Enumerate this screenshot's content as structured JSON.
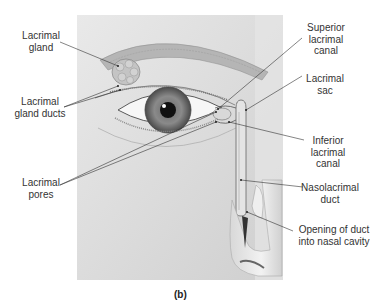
{
  "figure": {
    "caption": "(b)"
  },
  "labels": {
    "lacrimal_gland": "Lacrimal\ngland",
    "lacrimal_gland_ducts": "Lacrimal\ngland ducts",
    "lacrimal_pores": "Lacrimal\npores",
    "superior_lacrimal_canal": "Superior\nlacrimal\ncanal",
    "lacrimal_sac": "Lacrimal\nsac",
    "inferior_lacrimal_canal": "Inferior\nlacrimal\ncanal",
    "nasolacrimal_duct": "Nasolacrimal\nduct",
    "opening_of_duct": "Opening of duct\ninto nasal cavity"
  }
}
